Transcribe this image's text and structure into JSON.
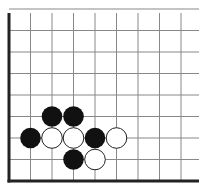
{
  "diagram": {
    "type": "go-board-position",
    "title_fragment": "",
    "board": {
      "origin_x": 9,
      "origin_y": 181,
      "cell": 21.5,
      "columns_visible": 9,
      "rows_visible": 9,
      "edges": [
        "left",
        "bottom"
      ],
      "line_color": "#888888",
      "edge_color": "#222222"
    },
    "stones": [
      {
        "color": "black",
        "col": 2,
        "row": 3
      },
      {
        "color": "black",
        "col": 3,
        "row": 3
      },
      {
        "color": "black",
        "col": 1,
        "row": 2
      },
      {
        "color": "white",
        "col": 2,
        "row": 2
      },
      {
        "color": "white",
        "col": 3,
        "row": 2
      },
      {
        "color": "black",
        "col": 4,
        "row": 2
      },
      {
        "color": "white",
        "col": 5,
        "row": 2
      },
      {
        "color": "black",
        "col": 3,
        "row": 1
      },
      {
        "color": "white",
        "col": 4,
        "row": 1
      }
    ],
    "colors": {
      "black_stone": "#111111",
      "white_stone": "#ffffff",
      "white_stone_outline": "#222222"
    }
  }
}
